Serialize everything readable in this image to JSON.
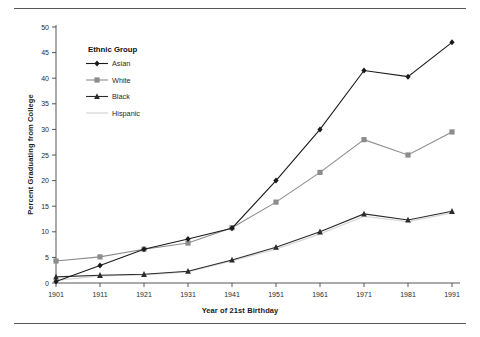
{
  "chart_data": {
    "type": "line",
    "title": "",
    "xlabel": "Year of 21st Birthday",
    "ylabel": "Percent Graduating from College",
    "categories": [
      1901,
      1911,
      1921,
      1931,
      1941,
      1951,
      1961,
      1971,
      1981,
      1991
    ],
    "xlim": [
      1901,
      1991
    ],
    "ylim": [
      0,
      50
    ],
    "ytick_step": 5,
    "yticks": [
      0,
      5,
      10,
      15,
      20,
      25,
      30,
      35,
      40,
      45,
      50
    ],
    "xticks": [
      "1901",
      "1911",
      "1921",
      "1931",
      "1941",
      "1951",
      "1961",
      "1971",
      "1981",
      "1991"
    ],
    "grid": false,
    "legend": {
      "title": "Ethnic Group",
      "position": "upper-left-inside",
      "entries": [
        "Asian",
        "White",
        "Black",
        "Hispanic"
      ]
    },
    "series": [
      {
        "name": "Asian",
        "color": "#1a1a1a",
        "marker": "diamond",
        "values": [
          0.3,
          3.4,
          6.6,
          8.6,
          10.7,
          20.0,
          30.0,
          41.5,
          40.3,
          47.0
        ]
      },
      {
        "name": "White",
        "color": "#8c8c8c",
        "marker": "square",
        "values": [
          4.3,
          5.1,
          6.6,
          7.8,
          10.8,
          15.8,
          21.6,
          28.0,
          25.0,
          29.5
        ]
      },
      {
        "name": "Black",
        "color": "#2b2b2b",
        "marker": "triangle",
        "values": [
          1.2,
          1.5,
          1.7,
          2.3,
          4.5,
          7.0,
          10.0,
          13.5,
          12.3,
          14.0
        ]
      },
      {
        "name": "Hispanic",
        "color": "#d8d8d8",
        "marker": "none",
        "values": [
          0.5,
          1.4,
          1.6,
          2.2,
          4.3,
          6.6,
          9.6,
          13.0,
          12.0,
          13.7
        ]
      }
    ]
  },
  "colors": {
    "asian": "#1a1a1a",
    "white": "#8c8c8c",
    "black": "#2b2b2b",
    "hispanic": "#d8d8d8",
    "axis": "#555555",
    "rule": "#555555"
  }
}
